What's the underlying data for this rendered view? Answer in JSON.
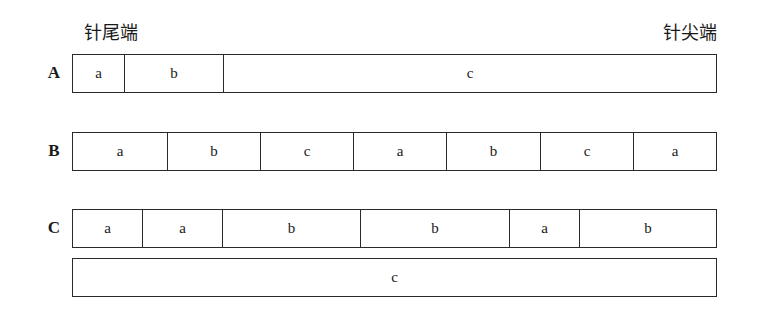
{
  "labels": {
    "tail_end": "针尾端",
    "tip_end": "针尖端"
  },
  "rows": [
    {
      "label": "A",
      "segments": [
        {
          "text": "a",
          "width": 52
        },
        {
          "text": "b",
          "width": 99
        },
        {
          "text": "c",
          "width": 494
        }
      ]
    },
    {
      "label": "B",
      "segments": [
        {
          "text": "a",
          "width": 95
        },
        {
          "text": "b",
          "width": 93
        },
        {
          "text": "c",
          "width": 93
        },
        {
          "text": "a",
          "width": 93
        },
        {
          "text": "b",
          "width": 94
        },
        {
          "text": "c",
          "width": 93
        },
        {
          "text": "a",
          "width": 84
        }
      ]
    },
    {
      "label": "C",
      "segments": [
        {
          "text": "a",
          "width": 70
        },
        {
          "text": "a",
          "width": 80
        },
        {
          "text": "b",
          "width": 138
        },
        {
          "text": "b",
          "width": 149
        },
        {
          "text": "a",
          "width": 70
        },
        {
          "text": "b",
          "width": 138
        }
      ]
    },
    {
      "label": "",
      "segments": [
        {
          "text": "c",
          "width": 645
        }
      ]
    }
  ]
}
